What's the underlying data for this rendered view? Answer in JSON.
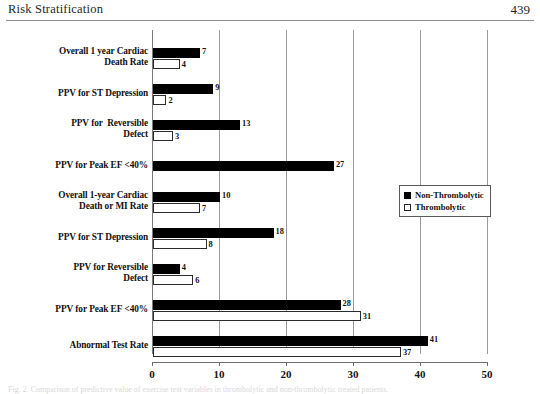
{
  "page": {
    "header_title": "Risk Stratification",
    "page_number": "439",
    "caption": "Fig. 2. Comparison of predictive value of exercise test variables in thrombolytic and non-thrombolytic treated patients."
  },
  "legend": {
    "items": [
      {
        "label": "Non-Thrombolytic",
        "swatch": "filled-square",
        "color": "#000000"
      },
      {
        "label": "Thrombolytic",
        "swatch": "open-square",
        "color": "#ffffff"
      }
    ]
  },
  "chart_data": {
    "type": "bar",
    "orientation": "horizontal",
    "title": "",
    "xlabel": "",
    "ylabel": "",
    "xlim": [
      0,
      50
    ],
    "xticks": [
      0,
      10,
      20,
      30,
      40,
      50
    ],
    "grid": true,
    "legend_position": "right",
    "categories": [
      "Overall 1 year Cardiac Death Rate",
      "PPV for ST Depression",
      "PPV for  Reversible Defect",
      "PPV for Peak EF <40%",
      "Overall 1-year Cardiac Death or MI Rate",
      "PPV for ST Depression",
      "PPV for Reversible Defect",
      "PPV for Peak EF <40%",
      "Abnormal Test Rate"
    ],
    "series": [
      {
        "name": "Non-Thrombolytic",
        "values": [
          7,
          9,
          13,
          27,
          10,
          18,
          4,
          28,
          41
        ]
      },
      {
        "name": "Thrombolytic",
        "values": [
          4,
          2,
          3,
          null,
          7,
          8,
          6,
          31,
          37
        ]
      }
    ]
  },
  "category_lines": [
    [
      "Overall 1 year Cardiac",
      "Death Rate"
    ],
    [
      "PPV for ST Depression"
    ],
    [
      "PPV for  Reversible",
      "Defect"
    ],
    [
      "PPV for Peak EF <40%"
    ],
    [
      "Overall 1-year Cardiac",
      "Death or MI Rate"
    ],
    [
      "PPV for ST Depression"
    ],
    [
      "PPV for Reversible",
      "Defect"
    ],
    [
      "PPV for Peak EF <40%"
    ],
    [
      "Abnormal Test Rate"
    ]
  ]
}
